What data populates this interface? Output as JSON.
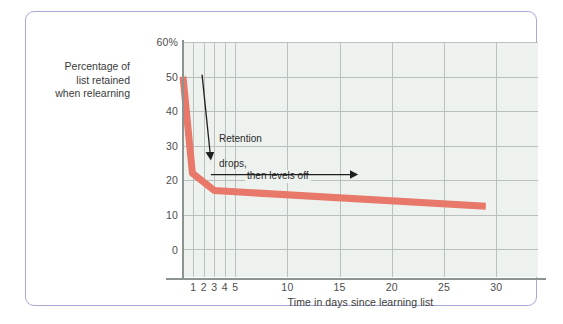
{
  "figure": {
    "frame_color": "#a6a9d6",
    "plot_bg": "#eef2ef",
    "grid_color": "#b9c0bd",
    "axis_color": "#8c9491",
    "curve_color": "#e8796a"
  },
  "chart_data": {
    "type": "line",
    "title": "",
    "xlabel": "Time in days since learning list",
    "ylabel": "Percentage of\nlist retained\nwhen relearning",
    "ylabel_lines": [
      "Percentage of",
      "list retained",
      "when relearning"
    ],
    "xlim": [
      0,
      34
    ],
    "ylim": [
      0,
      68
    ],
    "grid": true,
    "legend": "none",
    "xticks": [
      1,
      2,
      3,
      4,
      5,
      10,
      15,
      20,
      25,
      30
    ],
    "xticklabels": [
      "1",
      "2",
      "3",
      "4",
      "5",
      "10",
      "15",
      "20",
      "25",
      "30"
    ],
    "yticks": [
      0,
      10,
      20,
      30,
      40,
      50,
      60
    ],
    "yticklabels": [
      "0",
      "10",
      "20",
      "30",
      "40",
      "50",
      "60%"
    ],
    "series": [
      {
        "name": "Percentage of list retained when relearning",
        "color": "#e8796a",
        "x": [
          0,
          0.9,
          3,
          29
        ],
        "y": [
          58,
          30,
          25,
          20.5
        ]
      }
    ],
    "annotations": [
      {
        "id": "retention-drops",
        "text": "Retention\ndrops,",
        "line1": "Retention",
        "line2": "drops,",
        "arrow": "down"
      },
      {
        "id": "then-levels-off",
        "text": "then levels off",
        "arrow": "right"
      }
    ]
  }
}
